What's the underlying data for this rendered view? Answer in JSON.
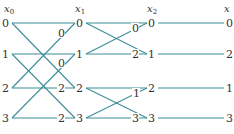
{
  "diagram": {
    "type": "fft-butterfly",
    "edge_color": "#3d8e9a",
    "text_color": "#333333",
    "columns": [
      {
        "id": "x0",
        "header": "x",
        "subscript": "0",
        "x": 8,
        "nodes": [
          "0",
          "1",
          "2",
          "3"
        ]
      },
      {
        "id": "x1",
        "header": "x",
        "subscript": "1",
        "x": 79,
        "nodes": [
          "0",
          "1",
          "2",
          "3"
        ]
      },
      {
        "id": "x2",
        "header": "x",
        "subscript": "2",
        "x": 151,
        "nodes": [
          "0",
          "1",
          "2",
          "3"
        ]
      },
      {
        "id": "x",
        "header": "x",
        "subscript": "",
        "x": 228,
        "nodes": [
          "0",
          "2",
          "1",
          "3"
        ]
      }
    ],
    "row_y": [
      23,
      54,
      88,
      118
    ],
    "stage1": {
      "edges": [
        [
          "0",
          "0"
        ],
        [
          "0",
          "2"
        ],
        [
          "1",
          "1"
        ],
        [
          "1",
          "3"
        ],
        [
          "2",
          "0"
        ],
        [
          "2",
          "2"
        ],
        [
          "3",
          "1"
        ],
        [
          "3",
          "3"
        ]
      ],
      "weights": [
        {
          "text": "0",
          "on_edge": "2->0"
        },
        {
          "text": "0",
          "on_edge": "3->1"
        },
        {
          "text": "2",
          "on_edge": "2->2"
        },
        {
          "text": "2",
          "on_edge": "3->3"
        }
      ]
    },
    "stage2": {
      "edges": [
        [
          "0",
          "0"
        ],
        [
          "0",
          "1"
        ],
        [
          "1",
          "0"
        ],
        [
          "1",
          "1"
        ],
        [
          "2",
          "2"
        ],
        [
          "2",
          "3"
        ],
        [
          "3",
          "2"
        ],
        [
          "3",
          "3"
        ]
      ],
      "weights": [
        {
          "text": "0",
          "on_edge": "1->0"
        },
        {
          "text": "2",
          "on_edge": "1->1"
        },
        {
          "text": "1",
          "on_edge": "3->2"
        },
        {
          "text": "3",
          "on_edge": "3->3"
        }
      ]
    },
    "stage3": {
      "edges": [
        [
          "0",
          "0"
        ],
        [
          "1",
          "2"
        ],
        [
          "2",
          "1"
        ],
        [
          "3",
          "3"
        ]
      ]
    }
  }
}
